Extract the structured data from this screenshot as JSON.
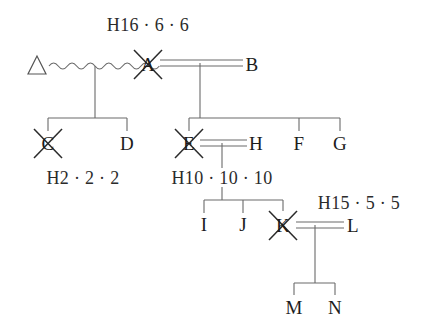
{
  "diagram": {
    "type": "pedigree-chart",
    "title": "",
    "line_color": "#4a4a4a",
    "text_color": "#1c1c1c",
    "background": "#ffffff"
  },
  "persons": [
    {
      "id": "triangle",
      "label": "",
      "icon": "triangle-symbol",
      "x": 37,
      "y": 66,
      "deceased": false
    },
    {
      "id": "A",
      "label": "A",
      "x": 148,
      "y": 64,
      "deceased": true
    },
    {
      "id": "B",
      "label": "B",
      "x": 252,
      "y": 64,
      "deceased": false
    },
    {
      "id": "C",
      "label": "C",
      "x": 48,
      "y": 143,
      "deceased": true
    },
    {
      "id": "D",
      "label": "D",
      "x": 127,
      "y": 143,
      "deceased": false
    },
    {
      "id": "E",
      "label": "E",
      "x": 189,
      "y": 143,
      "deceased": true
    },
    {
      "id": "H",
      "label": "H",
      "x": 256,
      "y": 143,
      "deceased": false
    },
    {
      "id": "F",
      "label": "F",
      "x": 299,
      "y": 143,
      "deceased": false
    },
    {
      "id": "G",
      "label": "G",
      "x": 340,
      "y": 143,
      "deceased": false
    },
    {
      "id": "I",
      "label": "I",
      "x": 204,
      "y": 224,
      "deceased": false
    },
    {
      "id": "J",
      "label": "J",
      "x": 243,
      "y": 224,
      "deceased": false
    },
    {
      "id": "K",
      "label": "K",
      "x": 283,
      "y": 225,
      "deceased": true
    },
    {
      "id": "L",
      "label": "L",
      "x": 353,
      "y": 225,
      "deceased": false
    },
    {
      "id": "M",
      "label": "M",
      "x": 294,
      "y": 307,
      "deceased": false
    },
    {
      "id": "N",
      "label": "N",
      "x": 335,
      "y": 307,
      "deceased": false
    }
  ],
  "haplotype_labels": [
    {
      "id": "h-A",
      "text": "H16 · 6 · 6",
      "x": 148,
      "y": 25
    },
    {
      "id": "h-C",
      "text": "H2 · 2 · 2",
      "x": 83,
      "y": 178
    },
    {
      "id": "h-E",
      "text": "H10 · 10 · 10",
      "x": 222,
      "y": 178
    },
    {
      "id": "h-K",
      "text": "H15 · 5 · 5",
      "x": 359,
      "y": 203
    }
  ],
  "unions": [
    {
      "id": "union-triangle-A",
      "type": "wavy",
      "partners": [
        "triangle",
        "A"
      ],
      "children": [
        "C",
        "D"
      ]
    },
    {
      "id": "union-A-B",
      "type": "double-line",
      "partners": [
        "A",
        "B"
      ],
      "children": [
        "E",
        "F",
        "G"
      ]
    },
    {
      "id": "union-E-H",
      "type": "double-line",
      "partners": [
        "E",
        "H"
      ],
      "children": [
        "I",
        "J",
        "K"
      ]
    },
    {
      "id": "union-K-L",
      "type": "double-line",
      "partners": [
        "K",
        "L"
      ],
      "children": [
        "M",
        "N"
      ]
    }
  ],
  "legend": {
    "deceased_marker": "x-cross-overlay",
    "unknown_individual": "triangle-symbol",
    "consanguineous_or_uncertain_link": "wavy-line"
  }
}
